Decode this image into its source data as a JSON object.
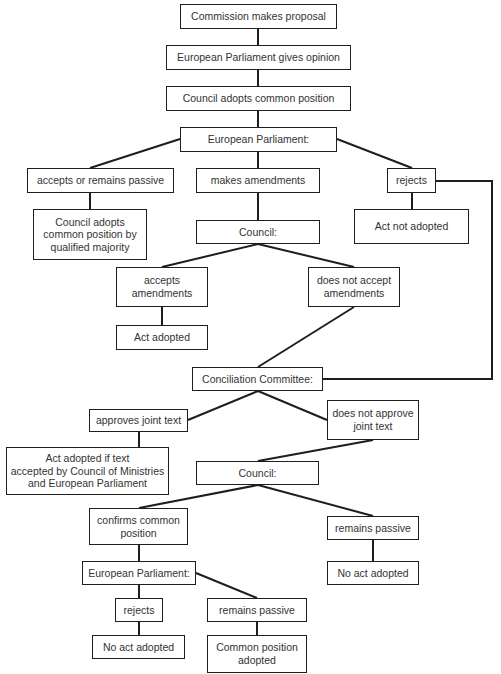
{
  "diagram": {
    "type": "flowchart",
    "title": "",
    "colors": {
      "line": "#1e1e1e",
      "text": "#333333",
      "background": "#ffffff"
    },
    "nodes": [
      {
        "id": "n1",
        "label": "Commission makes proposal",
        "x": 180,
        "y": 4,
        "w": 157,
        "h": 25
      },
      {
        "id": "n2",
        "label": "European Parliament gives opinion",
        "x": 166,
        "y": 45,
        "w": 185,
        "h": 25
      },
      {
        "id": "n3",
        "label": "Council adopts common position",
        "x": 166,
        "y": 86,
        "w": 185,
        "h": 25
      },
      {
        "id": "n4",
        "label": "European Parliament:",
        "x": 180,
        "y": 127,
        "w": 157,
        "h": 25
      },
      {
        "id": "n5",
        "label": "accepts or remains passive",
        "x": 27,
        "y": 168,
        "w": 147,
        "h": 25
      },
      {
        "id": "n6",
        "label": "makes amendments",
        "x": 196,
        "y": 168,
        "w": 124,
        "h": 25
      },
      {
        "id": "n7",
        "label": "rejects",
        "x": 387,
        "y": 168,
        "w": 49,
        "h": 25
      },
      {
        "id": "n8",
        "label": "Council adopts\ncommon position by\nqualified majority",
        "x": 33,
        "y": 209,
        "w": 114,
        "h": 51
      },
      {
        "id": "n9",
        "label": "Act not adopted",
        "x": 354,
        "y": 209,
        "w": 115,
        "h": 35
      },
      {
        "id": "n10",
        "label": "Council:",
        "x": 196,
        "y": 220,
        "w": 124,
        "h": 24
      },
      {
        "id": "n11",
        "label": "accepts\namendments",
        "x": 116,
        "y": 267,
        "w": 92,
        "h": 40
      },
      {
        "id": "n12",
        "label": "does not accept\namendments",
        "x": 308,
        "y": 267,
        "w": 92,
        "h": 40
      },
      {
        "id": "n13",
        "label": "Act adopted",
        "x": 116,
        "y": 325,
        "w": 92,
        "h": 25
      },
      {
        "id": "n14",
        "label": "Conciliation Committee:",
        "x": 192,
        "y": 367,
        "w": 131,
        "h": 24
      },
      {
        "id": "n15",
        "label": "approves joint text",
        "x": 89,
        "y": 409,
        "w": 99,
        "h": 23
      },
      {
        "id": "n16",
        "label": "does not approve\njoint text",
        "x": 327,
        "y": 400,
        "w": 92,
        "h": 40
      },
      {
        "id": "n17",
        "label": "Act adopted if text\naccepted by Council of Ministries\nand European Parliament",
        "x": 6,
        "y": 447,
        "w": 163,
        "h": 48
      },
      {
        "id": "n18",
        "label": "Council:",
        "x": 196,
        "y": 461,
        "w": 123,
        "h": 24
      },
      {
        "id": "n19",
        "label": "confirms common\nposition",
        "x": 89,
        "y": 508,
        "w": 99,
        "h": 37
      },
      {
        "id": "n20",
        "label": "remains passive",
        "x": 327,
        "y": 516,
        "w": 92,
        "h": 24
      },
      {
        "id": "n21",
        "label": "European Parliament:",
        "x": 82,
        "y": 561,
        "w": 114,
        "h": 24
      },
      {
        "id": "n22",
        "label": "No act adopted",
        "x": 327,
        "y": 561,
        "w": 92,
        "h": 24
      },
      {
        "id": "n23",
        "label": "rejects",
        "x": 115,
        "y": 598,
        "w": 48,
        "h": 24
      },
      {
        "id": "n24",
        "label": "remains passive",
        "x": 207,
        "y": 598,
        "w": 100,
        "h": 24
      },
      {
        "id": "n25",
        "label": "No act adopted",
        "x": 92,
        "y": 635,
        "w": 93,
        "h": 24
      },
      {
        "id": "n26",
        "label": "Common position\nadopted",
        "x": 207,
        "y": 635,
        "w": 100,
        "h": 38
      }
    ],
    "edges": [
      {
        "from": "n1",
        "to": "n2",
        "points": [
          [
            258,
            29
          ],
          [
            258,
            45
          ]
        ]
      },
      {
        "from": "n2",
        "to": "n3",
        "points": [
          [
            258,
            70
          ],
          [
            258,
            86
          ]
        ]
      },
      {
        "from": "n3",
        "to": "n4",
        "points": [
          [
            258,
            111
          ],
          [
            258,
            127
          ]
        ]
      },
      {
        "from": "n4",
        "to": "n5",
        "points": [
          [
            180,
            139
          ],
          [
            90,
            168
          ]
        ]
      },
      {
        "from": "n4",
        "to": "n6",
        "points": [
          [
            258,
            152
          ],
          [
            258,
            168
          ]
        ]
      },
      {
        "from": "n4",
        "to": "n7",
        "points": [
          [
            337,
            139
          ],
          [
            412,
            168
          ]
        ]
      },
      {
        "from": "n5",
        "to": "n8",
        "points": [
          [
            90,
            193
          ],
          [
            90,
            209
          ]
        ]
      },
      {
        "from": "n6",
        "to": "n10",
        "points": [
          [
            258,
            193
          ],
          [
            258,
            220
          ]
        ]
      },
      {
        "from": "n7",
        "to": "n9",
        "points": [
          [
            412,
            193
          ],
          [
            412,
            209
          ]
        ]
      },
      {
        "from": "n7",
        "to": "n14",
        "points": [
          [
            436,
            181
          ],
          [
            492,
            181
          ],
          [
            492,
            379
          ],
          [
            323,
            379
          ]
        ]
      },
      {
        "from": "n10",
        "to": "n11",
        "points": [
          [
            258,
            244
          ],
          [
            162,
            267
          ]
        ]
      },
      {
        "from": "n10",
        "to": "n12",
        "points": [
          [
            258,
            244
          ],
          [
            354,
            267
          ]
        ]
      },
      {
        "from": "n11",
        "to": "n13",
        "points": [
          [
            162,
            307
          ],
          [
            162,
            325
          ]
        ]
      },
      {
        "from": "n12",
        "to": "n14",
        "points": [
          [
            354,
            307
          ],
          [
            258,
            367
          ]
        ]
      },
      {
        "from": "n14",
        "to": "n15",
        "points": [
          [
            258,
            391
          ],
          [
            188,
            420
          ]
        ]
      },
      {
        "from": "n14",
        "to": "n16",
        "points": [
          [
            258,
            391
          ],
          [
            327,
            420
          ]
        ]
      },
      {
        "from": "n15",
        "to": "n17",
        "points": [
          [
            139,
            432
          ],
          [
            139,
            447
          ]
        ]
      },
      {
        "from": "n16",
        "to": "n18",
        "points": [
          [
            373,
            440
          ],
          [
            258,
            461
          ]
        ]
      },
      {
        "from": "n18",
        "to": "n19",
        "points": [
          [
            258,
            485
          ],
          [
            139,
            508
          ]
        ]
      },
      {
        "from": "n18",
        "to": "n20",
        "points": [
          [
            258,
            485
          ],
          [
            373,
            516
          ]
        ]
      },
      {
        "from": "n19",
        "to": "n21",
        "points": [
          [
            139,
            545
          ],
          [
            139,
            561
          ]
        ]
      },
      {
        "from": "n20",
        "to": "n22",
        "points": [
          [
            373,
            540
          ],
          [
            373,
            561
          ]
        ]
      },
      {
        "from": "n21",
        "to": "n23",
        "points": [
          [
            139,
            585
          ],
          [
            139,
            598
          ]
        ]
      },
      {
        "from": "n21",
        "to": "n24",
        "points": [
          [
            196,
            573
          ],
          [
            257,
            598
          ]
        ]
      },
      {
        "from": "n23",
        "to": "n25",
        "points": [
          [
            139,
            622
          ],
          [
            139,
            635
          ]
        ]
      },
      {
        "from": "n24",
        "to": "n26",
        "points": [
          [
            257,
            622
          ],
          [
            257,
            635
          ]
        ]
      }
    ]
  }
}
